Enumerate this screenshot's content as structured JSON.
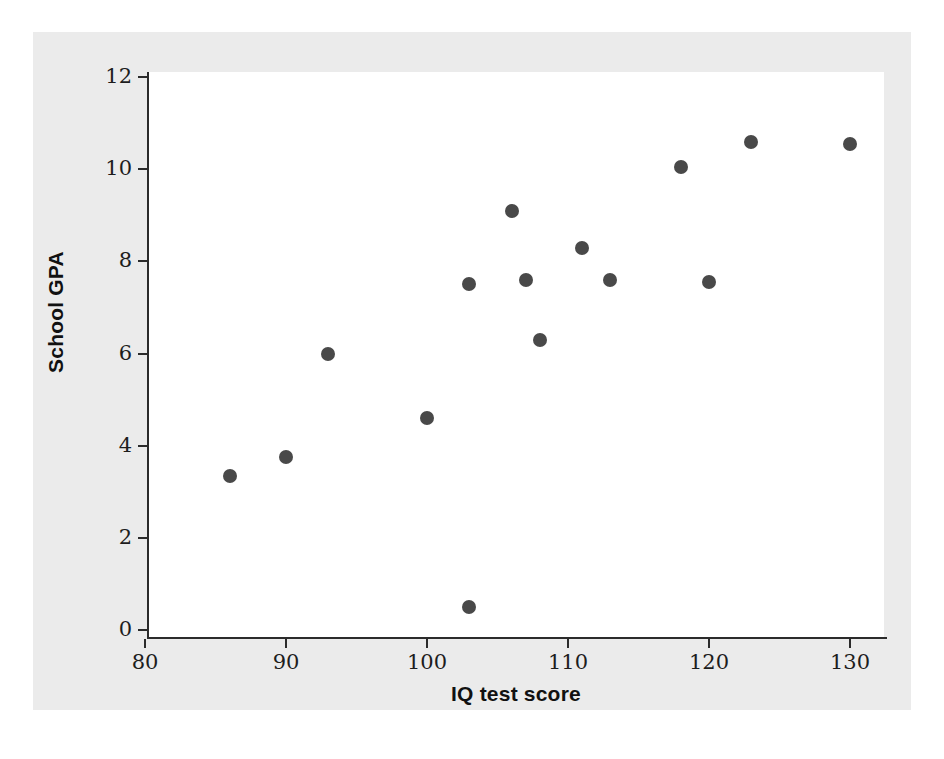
{
  "figure": {
    "background_color": "#ebebeb",
    "plot_background_color": "#ffffff",
    "axis_color": "#2b2b2b",
    "point_color": "#494949"
  },
  "chart_data": {
    "type": "scatter",
    "title": "",
    "xlabel": "IQ test score",
    "ylabel": "School GPA",
    "xlim": [
      78,
      132
    ],
    "ylim": [
      0,
      12.4
    ],
    "xticks": [
      80,
      90,
      100,
      110,
      120,
      130
    ],
    "yticks": [
      0,
      2,
      4,
      6,
      8,
      10,
      12
    ],
    "xtick_labels": [
      "80",
      "90",
      "100",
      "110",
      "120",
      "130"
    ],
    "ytick_labels": [
      "0",
      "2",
      "4",
      "6",
      "8",
      "10",
      "12"
    ],
    "grid": false,
    "legend": null,
    "series": [
      {
        "name": "students",
        "marker": "circle",
        "points": [
          {
            "x": 86,
            "y": 3.35
          },
          {
            "x": 90,
            "y": 3.75
          },
          {
            "x": 93,
            "y": 6.0
          },
          {
            "x": 100,
            "y": 4.6
          },
          {
            "x": 103,
            "y": 0.5
          },
          {
            "x": 103,
            "y": 7.5
          },
          {
            "x": 106,
            "y": 9.1
          },
          {
            "x": 107,
            "y": 7.6
          },
          {
            "x": 108,
            "y": 6.3
          },
          {
            "x": 111,
            "y": 8.3
          },
          {
            "x": 113,
            "y": 7.6
          },
          {
            "x": 118,
            "y": 10.05
          },
          {
            "x": 120,
            "y": 7.55
          },
          {
            "x": 123,
            "y": 10.6
          },
          {
            "x": 130,
            "y": 10.55
          }
        ]
      }
    ]
  }
}
